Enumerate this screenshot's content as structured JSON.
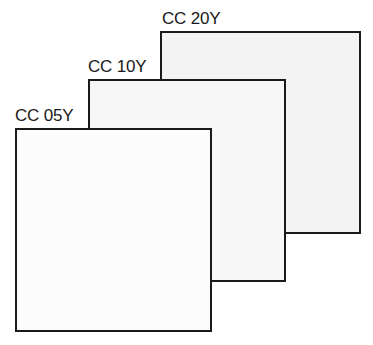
{
  "diagram": {
    "type": "stacked-filter-cards",
    "cards": [
      {
        "label": "CC 20Y",
        "fill": "#f3f3f3",
        "box": {
          "left": 160,
          "top": 31,
          "width": 201,
          "height": 203
        },
        "label_pos": {
          "left": 162,
          "top": 10
        }
      },
      {
        "label": "CC 10Y",
        "fill": "#f7f7f7",
        "box": {
          "left": 88,
          "top": 79,
          "width": 198,
          "height": 203
        },
        "label_pos": {
          "left": 88,
          "top": 58
        }
      },
      {
        "label": "CC 05Y",
        "fill": "#fcfcfc",
        "box": {
          "left": 15,
          "top": 128,
          "width": 197,
          "height": 204
        },
        "label_pos": {
          "left": 15,
          "top": 107
        }
      }
    ]
  }
}
